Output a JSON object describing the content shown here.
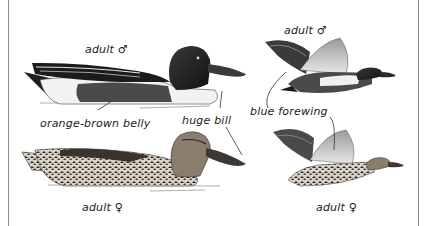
{
  "plate": {
    "subject": "Northern Shoveler",
    "figures": [
      {
        "id": "male-swimming",
        "label": "adult ♂"
      },
      {
        "id": "female-swimming",
        "label": "adult ♀"
      },
      {
        "id": "male-flying",
        "label": "adult ♂"
      },
      {
        "id": "female-flying",
        "label": "adult ♀"
      }
    ],
    "callouts": [
      {
        "id": "orange-brown-belly",
        "text": "orange-brown belly"
      },
      {
        "id": "huge-bill",
        "text": "huge bill"
      },
      {
        "id": "blue-forewing",
        "text": "blue forewing"
      }
    ]
  },
  "colors": {
    "ink": "#1a1a1a",
    "rule": "#8a8a8a",
    "head": "#2b2b2b",
    "belly": "#4a4a4a",
    "wing_light": "#b8b8b8",
    "female_body": "#7a6e60"
  }
}
